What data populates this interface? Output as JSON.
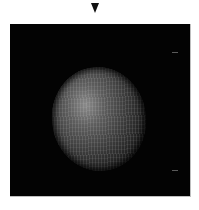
{
  "image": {
    "description": "Grayscale microscopy-style image of a textured spherical object on a black background",
    "marker": {
      "shape": "down-triangle",
      "color": "#111111"
    },
    "panel": {
      "background": "#030303"
    },
    "sphere": {
      "texture": "striated",
      "highlight": "#8a8a8a"
    },
    "annotations": [
      {
        "id": "tick-top",
        "label": ""
      },
      {
        "id": "tick-bottom",
        "label": ""
      }
    ]
  }
}
